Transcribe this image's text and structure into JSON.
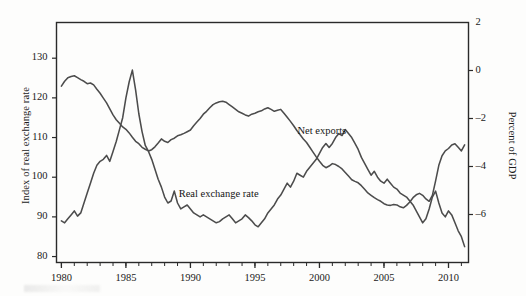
{
  "chart_data": {
    "type": "line",
    "title": "",
    "xlabel": "",
    "grid": false,
    "legend_position": "inline-annotations",
    "x": [
      1980.0,
      1980.25,
      1980.5,
      1980.75,
      1981.0,
      1981.25,
      1981.5,
      1981.75,
      1982.0,
      1982.25,
      1982.5,
      1982.75,
      1983.0,
      1983.25,
      1983.5,
      1983.75,
      1984.0,
      1984.25,
      1984.5,
      1984.75,
      1985.0,
      1985.25,
      1985.5,
      1985.75,
      1986.0,
      1986.25,
      1986.5,
      1986.75,
      1987.0,
      1987.25,
      1987.5,
      1987.75,
      1988.0,
      1988.25,
      1988.5,
      1988.75,
      1989.0,
      1989.25,
      1989.5,
      1989.75,
      1990.0,
      1990.25,
      1990.5,
      1990.75,
      1991.0,
      1991.25,
      1991.5,
      1991.75,
      1992.0,
      1992.25,
      1992.5,
      1992.75,
      1993.0,
      1993.25,
      1993.5,
      1993.75,
      1994.0,
      1994.25,
      1994.5,
      1994.75,
      1995.0,
      1995.25,
      1995.5,
      1995.75,
      1996.0,
      1996.25,
      1996.5,
      1996.75,
      1997.0,
      1997.25,
      1997.5,
      1997.75,
      1998.0,
      1998.25,
      1998.5,
      1998.75,
      1999.0,
      1999.25,
      1999.5,
      1999.75,
      2000.0,
      2000.25,
      2000.5,
      2000.75,
      2001.0,
      2001.25,
      2001.5,
      2001.75,
      2002.0,
      2002.25,
      2002.5,
      2002.75,
      2003.0,
      2003.25,
      2003.5,
      2003.75,
      2004.0,
      2004.25,
      2004.5,
      2004.75,
      2005.0,
      2005.25,
      2005.5,
      2005.75,
      2006.0,
      2006.25,
      2006.5,
      2006.75,
      2007.0,
      2007.25,
      2007.5,
      2007.75,
      2008.0,
      2008.25,
      2008.5,
      2008.75,
      2009.0,
      2009.25,
      2009.5,
      2009.75,
      2010.0,
      2010.25,
      2010.5,
      2010.75,
      2011.0,
      2011.25
    ],
    "series": [
      {
        "name": "Net exports",
        "axis": "right",
        "unit": "Percent of GDP",
        "color": "#4c4c4c",
        "label_x": 2000.0,
        "label_y": -2.55,
        "values": [
          -0.65,
          -0.45,
          -0.3,
          -0.25,
          -0.22,
          -0.3,
          -0.38,
          -0.45,
          -0.55,
          -0.52,
          -0.6,
          -0.78,
          -0.95,
          -1.15,
          -1.35,
          -1.6,
          -1.85,
          -2.05,
          -2.2,
          -2.35,
          -2.45,
          -2.6,
          -2.78,
          -2.95,
          -3.05,
          -3.2,
          -3.28,
          -3.35,
          -3.3,
          -3.18,
          -3.02,
          -2.85,
          -2.95,
          -3.0,
          -2.88,
          -2.82,
          -2.72,
          -2.68,
          -2.62,
          -2.55,
          -2.48,
          -2.3,
          -2.15,
          -2.0,
          -1.82,
          -1.7,
          -1.55,
          -1.42,
          -1.35,
          -1.3,
          -1.28,
          -1.32,
          -1.42,
          -1.52,
          -1.62,
          -1.72,
          -1.78,
          -1.85,
          -1.9,
          -1.82,
          -1.78,
          -1.72,
          -1.68,
          -1.6,
          -1.55,
          -1.62,
          -1.7,
          -1.66,
          -1.62,
          -1.78,
          -1.95,
          -2.12,
          -2.3,
          -2.5,
          -2.68,
          -2.85,
          -3.0,
          -3.2,
          -3.4,
          -3.6,
          -3.78,
          -3.95,
          -4.05,
          -3.98,
          -3.88,
          -3.92,
          -4.0,
          -4.1,
          -4.25,
          -4.4,
          -4.55,
          -4.62,
          -4.68,
          -4.8,
          -4.95,
          -5.1,
          -5.2,
          -5.3,
          -5.38,
          -5.45,
          -5.55,
          -5.6,
          -5.62,
          -5.58,
          -5.6,
          -5.68,
          -5.72,
          -5.62,
          -5.48,
          -5.3,
          -5.18,
          -5.12,
          -5.2,
          -5.35,
          -5.45,
          -5.2,
          -4.6,
          -3.95,
          -3.55,
          -3.35,
          -3.25,
          -3.1,
          -3.05,
          -3.2,
          -3.35,
          -3.1
        ]
      },
      {
        "name": "Real exchange rate",
        "axis": "left",
        "unit": "Index of real exchange rate",
        "color": "#4c4c4c",
        "label_x": 1992.5,
        "label_y": 95.5,
        "values": [
          89.0,
          88.5,
          89.5,
          90.5,
          91.5,
          90.2,
          91.0,
          93.5,
          96.0,
          98.5,
          101.0,
          103.0,
          104.0,
          104.5,
          105.5,
          104.0,
          106.5,
          109.0,
          112.0,
          115.0,
          120.0,
          124.0,
          127.0,
          122.0,
          116.0,
          111.5,
          108.0,
          106.5,
          104.5,
          102.0,
          99.5,
          97.5,
          95.0,
          93.5,
          94.0,
          96.5,
          93.5,
          92.0,
          92.5,
          93.0,
          92.0,
          91.0,
          90.5,
          90.0,
          90.5,
          90.0,
          89.5,
          89.0,
          88.5,
          88.8,
          89.5,
          90.0,
          90.5,
          89.5,
          88.5,
          89.0,
          89.5,
          90.5,
          89.8,
          89.0,
          88.0,
          87.5,
          88.5,
          89.5,
          91.0,
          92.0,
          93.0,
          94.5,
          95.5,
          97.0,
          98.5,
          97.5,
          99.0,
          101.0,
          100.5,
          100.0,
          101.5,
          102.5,
          103.5,
          104.5,
          106.0,
          107.5,
          108.5,
          107.5,
          108.5,
          110.0,
          111.0,
          110.5,
          112.0,
          111.0,
          110.0,
          108.5,
          107.0,
          105.0,
          103.5,
          102.0,
          100.5,
          101.5,
          100.0,
          99.0,
          98.5,
          99.5,
          98.5,
          97.5,
          97.0,
          96.0,
          95.5,
          95.0,
          94.0,
          93.0,
          91.5,
          90.0,
          88.5,
          89.5,
          92.0,
          95.0,
          96.5,
          93.5,
          91.0,
          90.0,
          91.5,
          90.5,
          88.5,
          86.5,
          85.0,
          82.5
        ]
      }
    ],
    "left_axis": {
      "title": "Index of real exchange rate",
      "ticks": [
        80,
        90,
        100,
        110,
        120,
        130
      ],
      "ylim": [
        78.5,
        139.0
      ]
    },
    "right_axis": {
      "title": "Percent of GDP",
      "ticks": [
        2,
        0,
        -2,
        -4,
        -6
      ],
      "tick_labels": [
        "2",
        "0",
        "–2",
        "–4",
        "–6"
      ],
      "ylim": [
        -8.0,
        2.0
      ]
    },
    "x_axis": {
      "ticks": [
        1980,
        1985,
        1990,
        1995,
        2000,
        2005,
        2010
      ],
      "tick_labels": [
        "1980",
        "1985",
        "1990",
        "1995",
        "2000",
        "2005",
        "2010"
      ],
      "minor_tick_interval": 1,
      "xlim": [
        1979.6,
        1911.0
      ]
    }
  }
}
